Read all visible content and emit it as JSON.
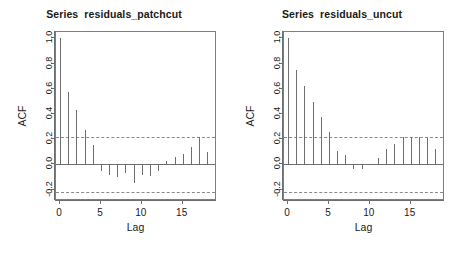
{
  "figure": {
    "background": "#ffffff",
    "line_color": "#6e6e6e",
    "dash_color": "#8a8a8a",
    "text_color": "#1a1a1a"
  },
  "panels": [
    {
      "id": "acf-patchcut",
      "title": "Series  residuals_patchcut",
      "xlabel": "Lag",
      "ylabel": "ACF"
    },
    {
      "id": "acf-uncut",
      "title": "Series  residuals_uncut",
      "xlabel": "Lag",
      "ylabel": "ACF"
    }
  ],
  "chart_data": [
    {
      "type": "bar",
      "id": "acf-patchcut",
      "title": "Series  residuals_patchcut",
      "xlabel": "Lag",
      "ylabel": "ACF",
      "xlim": [
        -0.5,
        19.2
      ],
      "ylim": [
        -0.29,
        1.05
      ],
      "xticks": [
        0,
        5,
        10,
        15
      ],
      "xticklabels": [
        "0",
        "5",
        "10",
        "15"
      ],
      "yticks": [
        -0.2,
        0.0,
        0.2,
        0.4,
        0.6,
        0.8,
        1.0
      ],
      "yticklabels": [
        "-0.2",
        "0.0",
        "0.2",
        "0.4",
        "0.6",
        "0.8",
        "1.0"
      ],
      "grid": false,
      "legend": null,
      "zero_line": 0.0,
      "confidence_bands": [
        0.215,
        -0.215
      ],
      "categories": [
        0,
        1,
        2,
        3,
        4,
        5,
        6,
        7,
        8,
        9,
        10,
        11,
        12,
        13,
        14,
        15,
        16,
        17,
        18
      ],
      "values": [
        1.0,
        0.575,
        0.43,
        0.275,
        0.155,
        -0.055,
        -0.085,
        -0.1,
        -0.07,
        -0.145,
        -0.085,
        -0.09,
        -0.055,
        0.03,
        0.055,
        0.08,
        0.135,
        0.215,
        0.095
      ]
    },
    {
      "type": "bar",
      "id": "acf-uncut",
      "title": "Series  residuals_uncut",
      "xlabel": "Lag",
      "ylabel": "ACF",
      "xlim": [
        -0.5,
        19.2
      ],
      "ylim": [
        -0.29,
        1.05
      ],
      "xticks": [
        0,
        5,
        10,
        15
      ],
      "xticklabels": [
        "0",
        "5",
        "10",
        "15"
      ],
      "yticks": [
        -0.2,
        0.0,
        0.2,
        0.4,
        0.6,
        0.8,
        1.0
      ],
      "yticklabels": [
        "-0.2",
        "0.0",
        "0.2",
        "0.4",
        "0.6",
        "0.8",
        "1.0"
      ],
      "grid": false,
      "legend": null,
      "zero_line": 0.0,
      "confidence_bands": [
        0.215,
        -0.215
      ],
      "categories": [
        0,
        1,
        2,
        3,
        4,
        5,
        6,
        7,
        8,
        9,
        10,
        11,
        12,
        13,
        14,
        15,
        16,
        17,
        18,
        19
      ],
      "values": [
        1.0,
        0.745,
        0.625,
        0.495,
        0.38,
        0.26,
        0.105,
        0.075,
        -0.035,
        -0.04,
        0.005,
        0.05,
        0.125,
        0.165,
        0.215,
        0.215,
        0.215,
        0.21,
        0.12,
        -0.01
      ]
    }
  ]
}
